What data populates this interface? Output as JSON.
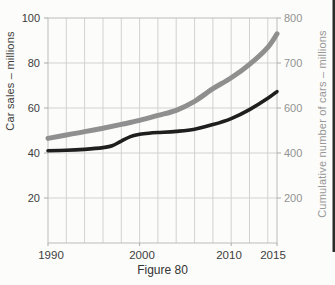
{
  "figure": {
    "caption": "Figure 80"
  },
  "colors": {
    "background": "#fcfcfa",
    "gridline": "#d2d2d0",
    "spine": "#bcbcba",
    "tick_mark": "#ababab",
    "left_text": "#3d3d3d",
    "right_text": "#939393",
    "car_sales_line": "#1f1f1f",
    "cumulative_line": "#8f8f8f",
    "page_edge": "#2b2b2b"
  },
  "chart_data": {
    "type": "line",
    "caption": "Figure 80",
    "x_axis": {
      "range": [
        1990,
        2015
      ],
      "gridline_step_years": 2,
      "tick_labels": [
        {
          "text": "1990",
          "year": 1990,
          "dx": 3
        },
        {
          "text": "2000",
          "year": 2000,
          "dx": 2
        },
        {
          "text": "2010",
          "year": 2010,
          "dx": -2
        },
        {
          "text": "2015",
          "year": 2015,
          "dx": -4
        }
      ]
    },
    "left_axis": {
      "title": "Car sales – millions",
      "range": [
        0,
        100
      ],
      "ticks": [
        100,
        80,
        60,
        40,
        20
      ]
    },
    "right_axis": {
      "title": "Cumulative number of cars – millions",
      "ticks": [
        {
          "label": "800",
          "value": 800,
          "at_left_value": 100
        },
        {
          "label": "700",
          "value": 700,
          "at_left_value": 80
        },
        {
          "label": "600",
          "value": 600,
          "at_left_value": 60
        },
        {
          "label": "400",
          "value": 400,
          "at_left_value": 40
        },
        {
          "label": "200",
          "value": 200,
          "at_left_value": 20
        }
      ]
    },
    "series": [
      {
        "name": "Car sales",
        "axis": "left",
        "color": "#1f1f1f",
        "stroke_width": 3.6,
        "x": [
          1990,
          1992,
          1994,
          1996,
          1997,
          1998,
          1999,
          2000,
          2001,
          2002,
          2004,
          2006,
          2008,
          2010,
          2012,
          2014,
          2015
        ],
        "y": [
          41,
          41.2,
          41.6,
          42.4,
          43.2,
          45.3,
          47.3,
          48.3,
          48.8,
          49.1,
          49.6,
          50.6,
          52.6,
          55.3,
          59.3,
          64.3,
          67.3
        ]
      },
      {
        "name": "Cumulative number of cars",
        "axis": "right",
        "color": "#8f8f8f",
        "stroke_width": 5,
        "x": [
          1990,
          1992,
          1994,
          1996,
          1998,
          2000,
          2002,
          2004,
          2006,
          2008,
          2010,
          2012,
          2014,
          2015
        ],
        "y": [
          465,
          480,
          495,
          510,
          527,
          545,
          567,
          590,
          615,
          643,
          667,
          697,
          735,
          765
        ]
      }
    ]
  }
}
